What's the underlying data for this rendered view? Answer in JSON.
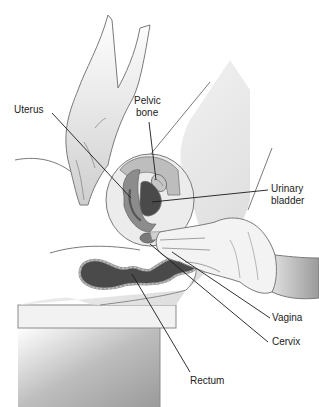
{
  "figure": {
    "labels": [
      {
        "id": "uterus",
        "text": "Uterus",
        "x": 14,
        "y": 104
      },
      {
        "id": "pelvic-bone-1",
        "text": "Pelvic",
        "x": 134,
        "y": 95
      },
      {
        "id": "pelvic-bone-2",
        "text": "bone",
        "x": 136,
        "y": 107
      },
      {
        "id": "urinary-bladder-1",
        "text": "Urinary",
        "x": 271,
        "y": 183
      },
      {
        "id": "urinary-bladder-2",
        "text": "bladder",
        "x": 271,
        "y": 195
      },
      {
        "id": "vagina",
        "text": "Vagina",
        "x": 272,
        "y": 312
      },
      {
        "id": "cervix",
        "text": "Cervix",
        "x": 272,
        "y": 336
      },
      {
        "id": "rectum",
        "text": "Rectum",
        "x": 190,
        "y": 375
      }
    ],
    "colors": {
      "outline": "#6e6e6e",
      "leader": "#1a1a1a",
      "skin_light": "#e6e6e6",
      "skin_mid": "#c8c8c8",
      "organ_dark": "#4a4a4a",
      "organ_mid": "#8c8c8c",
      "table_top": "#efefef",
      "glove": "#f0f0f0"
    }
  }
}
